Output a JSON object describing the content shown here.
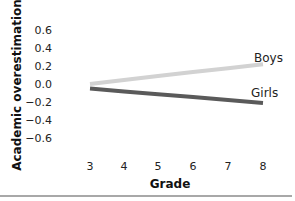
{
  "chart_data": {
    "type": "line",
    "title": "",
    "xlabel": "Grade",
    "ylabel": "Academic overestimation",
    "x": [
      3,
      4,
      5,
      6,
      7,
      8
    ],
    "x_tick_labels": [
      "3",
      "4",
      "5",
      "6",
      "7",
      "8"
    ],
    "y_tick_labels": [
      "0.6",
      "0.4",
      "0.2",
      "0.0",
      "−0.2",
      "−0.4",
      "−0.6"
    ],
    "y_ticks": [
      0.6,
      0.4,
      0.2,
      0.0,
      -0.2,
      -0.4,
      -0.6
    ],
    "ylim": [
      -0.6,
      0.6
    ],
    "grid": false,
    "legend_position": "inline-right",
    "series": [
      {
        "name": "Boys",
        "values": [
          0.0,
          0.044,
          0.088,
          0.132,
          0.176,
          0.22
        ],
        "color": "#d2d2d2"
      },
      {
        "name": "Girls",
        "values": [
          -0.05,
          -0.082,
          -0.114,
          -0.146,
          -0.178,
          -0.21
        ],
        "color": "#5a5a5a"
      }
    ]
  },
  "labels": {
    "boys": "Boys",
    "girls": "Girls",
    "xlabel": "Grade",
    "ylabel": "Academic overestimation"
  }
}
